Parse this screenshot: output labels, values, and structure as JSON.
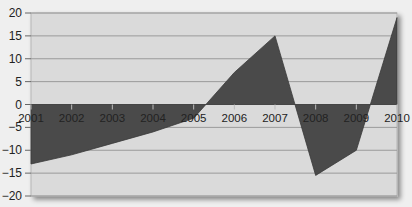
{
  "chart_data": {
    "type": "area",
    "title": "",
    "xlabel": "",
    "ylabel": "",
    "categories": [
      "2001",
      "2002",
      "2003",
      "2004",
      "2005",
      "2006",
      "2007",
      "2008",
      "2009",
      "2010"
    ],
    "values": [
      -13,
      -11,
      -8.5,
      -6,
      -3,
      7,
      15,
      -15.5,
      -10,
      19
    ],
    "interpolated": [
      "2006"
    ],
    "ylim": [
      -20,
      20
    ],
    "yticks": [
      20,
      15,
      10,
      5,
      0,
      -5,
      -10,
      -15,
      -20
    ],
    "ytick_labels": [
      "20",
      "15",
      "10",
      "5",
      "0",
      "−5",
      "−10",
      "−15",
      "−20"
    ],
    "grid": true,
    "legend": null,
    "colors": {
      "fill": "#4a4a4a",
      "plot_bg": "#dadada",
      "page_bg": "#efefef",
      "grid": "#9a9a9a"
    }
  }
}
